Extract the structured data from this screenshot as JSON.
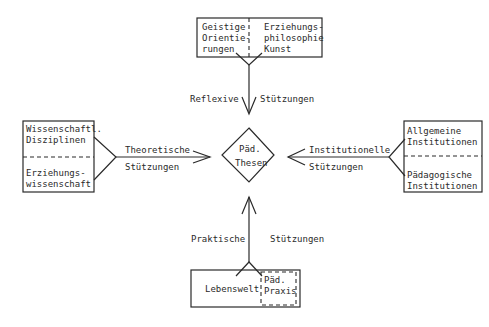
{
  "diagram": {
    "center": {
      "line1": "Päd.",
      "line2": "Thesen"
    },
    "top": {
      "box_left": [
        "Geistige",
        "Orientie-",
        "rungen"
      ],
      "box_right": [
        "Erziehungs-",
        "philosophie",
        "Kunst"
      ],
      "label_left": "Reflexive",
      "label_right": "Stützungen"
    },
    "left": {
      "box_top": [
        "Wissenschaftl.",
        "Disziplinen"
      ],
      "box_bottom": [
        "Erziehungs-",
        "wissenschaft"
      ],
      "label_top": "Theoretische",
      "label_bottom": "Stützungen"
    },
    "right": {
      "box_top": [
        "Allgemeine",
        "Institutionen"
      ],
      "box_bottom": [
        "Pädagogische",
        "Institutionen"
      ],
      "label_top": "Institutionelle",
      "label_bottom": "Stützungen"
    },
    "bottom": {
      "box_left": "Lebenswelt",
      "box_inner": [
        "Päd.",
        "Praxis"
      ],
      "label_left": "Praktische",
      "label_right": "Stützungen"
    },
    "colors": {
      "ink": "#2a2a2a",
      "background": "#ffffff"
    }
  }
}
